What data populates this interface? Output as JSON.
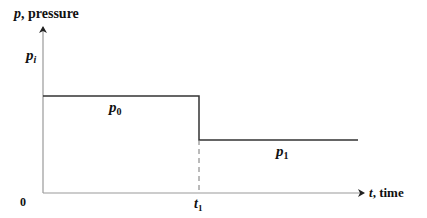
{
  "diagram": {
    "y_axis": {
      "symbol": "p",
      "label": ", pressure"
    },
    "x_axis": {
      "symbol": "t",
      "label": ", time"
    },
    "origin_label": "0",
    "pi_label": {
      "symbol": "p",
      "sub": "i"
    },
    "p0_label": {
      "symbol": "p",
      "sub": "0"
    },
    "p1_label": {
      "symbol": "p",
      "sub": "1"
    },
    "t1_label": {
      "symbol": "t",
      "sub": "1"
    },
    "colors": {
      "line": "#333333",
      "axis": "#999999",
      "text": "#111111"
    }
  }
}
